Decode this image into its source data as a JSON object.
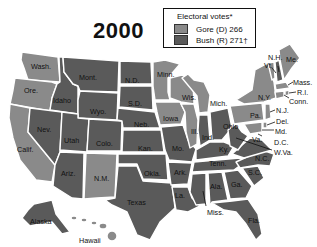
{
  "title": "2000",
  "legend": {
    "title": "Electoral votes*",
    "items": [
      {
        "label": "Gore (D) 266",
        "color": "#8a8a8a"
      },
      {
        "label": "Bush (R) 271†",
        "color": "#5a5a5a"
      }
    ]
  },
  "colors": {
    "gore": "#8a8a8a",
    "bush": "#5a5a5a"
  },
  "states": {
    "wash": "Wash.",
    "ore": "Ore.",
    "calif": "Calif.",
    "idaho": "Idaho",
    "nev": "Nev.",
    "mont": "Mont.",
    "wyo": "Wyo.",
    "utah": "Utah",
    "colo": "Colo.",
    "ariz": "Ariz.",
    "nm": "N.M.",
    "nd": "N.D.",
    "sd": "S.D.",
    "neb": "Neb.",
    "kan": "Kan.",
    "okla": "Okla.",
    "texas": "Texas",
    "minn": "Minn.",
    "iowa": "Iowa",
    "mo": "Mo.",
    "ark": "Ark.",
    "la": "La.",
    "wis": "Wis.",
    "ill": "Ill.",
    "mich": "Mich.",
    "ind": "Ind.",
    "ohio": "Ohio",
    "ky": "Ky.",
    "tenn": "Tenn.",
    "miss": "Miss.",
    "ala": "Ala.",
    "ga": "Ga.",
    "fla": "Fla.",
    "sc": "S.C.",
    "nc": "N.C.",
    "va": "Va.",
    "wva": "W.Va.",
    "pa": "Pa.",
    "ny": "N.Y.",
    "vt": "Vt.",
    "nh": "N.H.",
    "me": "Me.",
    "mass": "Mass.",
    "ri": "R.I.",
    "conn": "Conn.",
    "nj": "N.J.",
    "del": "Del.",
    "md": "Md.",
    "dc": "D.C.",
    "alaska": "Alaska",
    "hawaii": "Hawaii"
  }
}
